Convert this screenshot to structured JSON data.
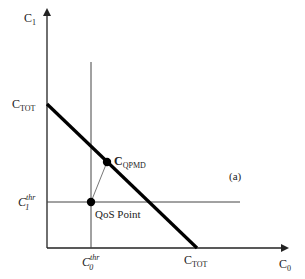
{
  "figure": {
    "panel_label": "(a)",
    "axes": {
      "x": {
        "name": "C",
        "subscript": "0"
      },
      "y": {
        "name": "C",
        "subscript": "1"
      }
    },
    "intercepts": {
      "y_intercept": {
        "name": "C",
        "subscript": "TOT"
      },
      "x_intercept": {
        "name": "C",
        "subscript": "TOT"
      }
    },
    "thresholds": {
      "x_threshold": {
        "name": "C",
        "subscript": "0",
        "superscript": "thr"
      },
      "y_threshold": {
        "name": "C",
        "subscript": "1",
        "superscript": "thr"
      }
    },
    "points": {
      "qos": {
        "label": "QoS Point"
      },
      "qpmd": {
        "name": "C",
        "subscript": "QPMD"
      }
    },
    "colors": {
      "axis": "#222222",
      "budget_line": "#000000",
      "threshold_lines": "#444444",
      "connector": "#777777"
    }
  }
}
